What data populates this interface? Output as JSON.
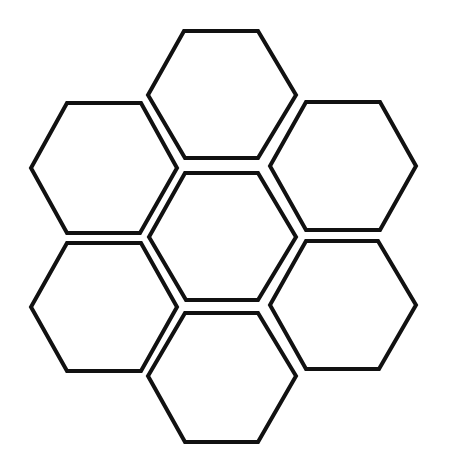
{
  "diagram": {
    "type": "hexagon-cluster",
    "background": "#ffffff",
    "stroke_color": "#111111",
    "stroke_width": 4,
    "hexagons": [
      {
        "id": "top",
        "points": "184,31 258,31 296,95 258,158 185,158 148,95"
      },
      {
        "id": "upper-left",
        "points": "67,103 141,103 177,168 140,233 67,233 31,168"
      },
      {
        "id": "upper-right",
        "points": "306,102 380,102 416,166 380,230 306,230 270,166"
      },
      {
        "id": "center",
        "points": "185,173 258,173 296,237 258,300 186,300 149,237"
      },
      {
        "id": "lower-left",
        "points": "67,243 141,243 177,307 141,371 67,371 31,307"
      },
      {
        "id": "lower-right",
        "points": "306,241 378,241 416,305 379,369 306,369 270,305"
      },
      {
        "id": "bottom",
        "points": "185,313 258,313 296,376 258,442 185,442 148,376"
      }
    ]
  }
}
